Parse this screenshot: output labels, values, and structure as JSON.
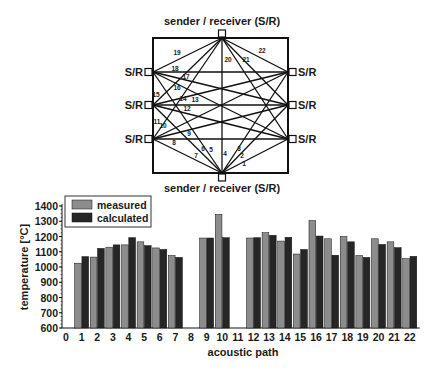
{
  "diagram": {
    "top_label": "sender / receiver (S/R)",
    "bottom_label": "sender / receiver (S/R)",
    "side_label": "S/R",
    "path_labels": [
      {
        "n": "1",
        "x": 244,
        "y": 166
      },
      {
        "n": "2",
        "x": 242,
        "y": 158
      },
      {
        "n": "3",
        "x": 239,
        "y": 151
      },
      {
        "n": "4",
        "x": 225,
        "y": 156
      },
      {
        "n": "5",
        "x": 211,
        "y": 152
      },
      {
        "n": "6",
        "x": 203,
        "y": 151
      },
      {
        "n": "7",
        "x": 196,
        "y": 158
      },
      {
        "n": "8",
        "x": 174,
        "y": 145
      },
      {
        "n": "9",
        "x": 189,
        "y": 136
      },
      {
        "n": "10",
        "x": 163,
        "y": 128
      },
      {
        "n": "11",
        "x": 157,
        "y": 124
      },
      {
        "n": "12",
        "x": 187,
        "y": 111
      },
      {
        "n": "13",
        "x": 195,
        "y": 102
      },
      {
        "n": "14",
        "x": 183,
        "y": 101
      },
      {
        "n": "15",
        "x": 156,
        "y": 97
      },
      {
        "n": "16",
        "x": 177,
        "y": 90
      },
      {
        "n": "17",
        "x": 186,
        "y": 79
      },
      {
        "n": "18",
        "x": 175,
        "y": 71
      },
      {
        "n": "19",
        "x": 177,
        "y": 55
      },
      {
        "n": "20",
        "x": 228,
        "y": 62
      },
      {
        "n": "21",
        "x": 246,
        "y": 62
      },
      {
        "n": "22",
        "x": 262,
        "y": 53
      }
    ]
  },
  "chart_data": {
    "type": "bar",
    "title": "",
    "xlabel": "acoustic path",
    "ylabel": "temperature [°C]",
    "ylim": [
      600,
      1400
    ],
    "yticks": [
      600,
      700,
      800,
      900,
      1000,
      1100,
      1200,
      1300,
      1400
    ],
    "xticks": [
      "0",
      "1",
      "2",
      "3",
      "4",
      "5",
      "6",
      "7",
      "8",
      "9",
      "10",
      "11",
      "12",
      "13",
      "14",
      "15",
      "16",
      "17",
      "18",
      "19",
      "20",
      "21",
      "22"
    ],
    "categories": [
      "1",
      "2",
      "3",
      "4",
      "5",
      "6",
      "7",
      "8",
      "9",
      "10",
      "11",
      "12",
      "13",
      "14",
      "15",
      "16",
      "17",
      "18",
      "19",
      "20",
      "21",
      "22"
    ],
    "legend_position": "upper left",
    "grid": false,
    "series": [
      {
        "name": "measured",
        "color": "#8c8c8c",
        "values": [
          1025,
          1065,
          1130,
          1145,
          1165,
          1125,
          1075,
          null,
          1190,
          1345,
          null,
          1190,
          1225,
          1170,
          1085,
          1305,
          1185,
          1200,
          1075,
          1185,
          1165,
          1055
        ]
      },
      {
        "name": "calculated",
        "color": "#262626",
        "values": [
          1068,
          1122,
          1145,
          1192,
          1140,
          1115,
          1063,
          null,
          1190,
          1192,
          null,
          1192,
          1208,
          1195,
          1115,
          1203,
          1077,
          1165,
          1063,
          1148,
          1127,
          1070
        ]
      }
    ]
  }
}
